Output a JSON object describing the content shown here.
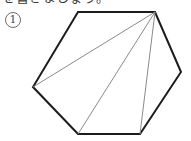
{
  "page": {
    "width": 191,
    "height": 141,
    "background_color": "#ffffff"
  },
  "instruction": {
    "text": "を書きましょう。",
    "note": "clipped at top of image"
  },
  "item": {
    "number_label": "1",
    "marker_style": "circled-numeral"
  },
  "figure": {
    "caption": "hexagon divided into triangles by diagonals from one vertex",
    "shape_name": "hexagon",
    "outline_color": "#1c1c1c",
    "outline_width": 2,
    "diagonal_color": "#8a8a8a",
    "diagonal_width": 1,
    "fill_color": "#ffffff",
    "vertices": [
      {
        "name": "top-left",
        "x": 78,
        "y": 12
      },
      {
        "name": "top-right",
        "x": 155,
        "y": 12
      },
      {
        "name": "right",
        "x": 181,
        "y": 72
      },
      {
        "name": "bottom-right",
        "x": 140,
        "y": 134
      },
      {
        "name": "bottom-left",
        "x": 78,
        "y": 134
      },
      {
        "name": "left",
        "x": 33,
        "y": 87
      }
    ],
    "diagonals": [
      {
        "name": "apex-to-left",
        "from": "top-right",
        "to": "left",
        "x1": 155,
        "y1": 12,
        "x2": 33,
        "y2": 87
      },
      {
        "name": "apex-to-bottom-left",
        "from": "top-right",
        "to": "bottom-left",
        "x1": 155,
        "y1": 12,
        "x2": 78,
        "y2": 134
      },
      {
        "name": "apex-to-bottom-right",
        "from": "top-right",
        "to": "bottom-right",
        "x1": 155,
        "y1": 12,
        "x2": 140,
        "y2": 134
      }
    ],
    "triangle_count": 4
  }
}
